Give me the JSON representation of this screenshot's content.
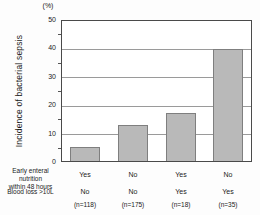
{
  "chart_data": {
    "type": "bar",
    "unit_label": "(%)",
    "ylabel": "Incidence of bacterial sepsis",
    "ylim": [
      0,
      50
    ],
    "yticks": [
      "50",
      "40",
      "30",
      "20",
      "10",
      "0"
    ],
    "ytick_minor_values": [
      45,
      35,
      25,
      15,
      5
    ],
    "grid": "horizontal major gridlines at 10,20,30,40",
    "values": [
      5,
      13,
      17,
      40
    ],
    "rows": [
      {
        "label_lines": [
          "Early enteral nutrition",
          "within 48 hours"
        ],
        "values": [
          "Yes",
          "No",
          "Yes",
          "No"
        ]
      },
      {
        "label_lines": [
          "Blood loss >10L"
        ],
        "values": [
          "No",
          "No",
          "Yes",
          "Yes"
        ]
      }
    ],
    "n_labels": [
      "(n=118)",
      "(n=175)",
      "(n=18)",
      "(n=35)"
    ],
    "colors": {
      "bar_fill": "#b9b9b9",
      "bar_border": "#7f7f7f",
      "grid_line": "#9a9a9a",
      "axis_line": "#4a4a4a"
    }
  }
}
